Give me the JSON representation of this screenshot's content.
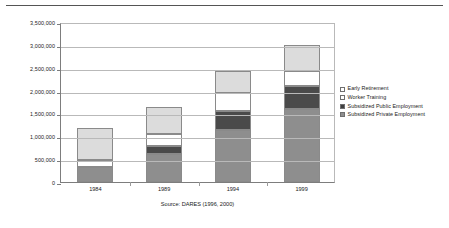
{
  "chart_data": {
    "type": "bar",
    "stacked": true,
    "title": "",
    "xlabel": "",
    "ylabel": "",
    "categories": [
      "1984",
      "1989",
      "1994",
      "1999"
    ],
    "ylim": [
      0,
      3500000
    ],
    "ytick_values": [
      0,
      500000,
      1000000,
      1500000,
      2000000,
      2500000,
      3000000,
      3500000
    ],
    "ytick_labels": [
      "0",
      "500,000",
      "1,000,000",
      "1,500,000",
      "2,000,000",
      "2,500,000",
      "3,000,000",
      "3,500,000"
    ],
    "grid": true,
    "legend_position": "right",
    "series": [
      {
        "name": "Subsidized Private Employment",
        "color": "#8e8e8e",
        "values": [
          320000,
          620000,
          1140000,
          1600000
        ]
      },
      {
        "name": "Subsidized Public Employment",
        "color": "#4a4a4a",
        "values": [
          0,
          170000,
          410000,
          510000
        ]
      },
      {
        "name": "Worker Training",
        "color": "#ffffff",
        "values": [
          160000,
          260000,
          390000,
          310000
        ]
      },
      {
        "name": "Early Retirement",
        "color": "#dcdcdc",
        "values": [
          700000,
          600000,
          490000,
          580000
        ]
      }
    ],
    "totals": [
      1180000,
      1650000,
      2430000,
      3000000
    ],
    "annotations": [
      "Source: DARES (1996, 2000)"
    ]
  },
  "legend": {
    "items": [
      {
        "label": "Early Retirement",
        "swatch": "s-retire"
      },
      {
        "label": "Worker Training",
        "swatch": "s-training"
      },
      {
        "label": "Subsidized Public Employment",
        "swatch": "s-public"
      },
      {
        "label": "Subsidized Private Employment",
        "swatch": "s-private"
      }
    ]
  },
  "caption": {
    "source": "Source: DARES (1996, 2000)"
  }
}
